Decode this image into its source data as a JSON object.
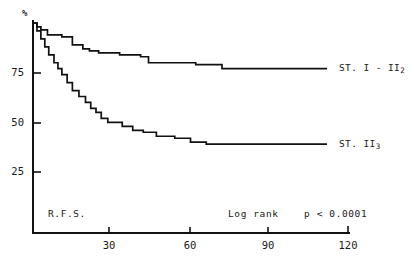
{
  "chart_data": {
    "type": "line",
    "title": "",
    "subtitle": "",
    "xlabel": "",
    "ylabel": "%",
    "xlim": [
      0,
      120
    ],
    "ylim": [
      0,
      100
    ],
    "grid": false,
    "legend_position": "right-inline",
    "x_ticks": [
      "30",
      "60",
      "90",
      "120"
    ],
    "x_tick_values": [
      30,
      60,
      90,
      120
    ],
    "y_ticks": [
      "25",
      "50",
      "75"
    ],
    "y_tick_values": [
      25,
      50,
      75
    ],
    "y_axis_symbol": "%",
    "annotations": [
      {
        "name": "endpoint",
        "text": "R.F.S."
      },
      {
        "name": "test-name",
        "text": "Log rank"
      },
      {
        "name": "p-value",
        "text": "p < 0.0001"
      }
    ],
    "series": [
      {
        "name": "ST. I - II2",
        "label_main": "ST. I - II",
        "label_sub": "2",
        "color": "#111111",
        "points": [
          [
            0,
            100
          ],
          [
            1.5,
            100
          ],
          [
            1.5,
            98
          ],
          [
            3,
            98
          ],
          [
            3,
            96.5
          ],
          [
            5.5,
            96.5
          ],
          [
            5.5,
            94
          ],
          [
            11,
            94
          ],
          [
            11,
            93
          ],
          [
            15,
            93
          ],
          [
            15,
            89
          ],
          [
            19,
            89
          ],
          [
            19,
            87
          ],
          [
            21.5,
            87
          ],
          [
            21.5,
            86
          ],
          [
            25,
            86
          ],
          [
            25,
            85
          ],
          [
            33,
            85
          ],
          [
            33,
            84
          ],
          [
            41,
            84
          ],
          [
            41,
            83
          ],
          [
            44,
            83
          ],
          [
            44,
            80
          ],
          [
            62,
            80
          ],
          [
            62,
            79
          ],
          [
            72,
            79
          ],
          [
            72,
            77
          ],
          [
            112,
            77
          ]
        ]
      },
      {
        "name": "ST. II3",
        "label_main": "ST. II",
        "label_sub": "3",
        "color": "#111111",
        "points": [
          [
            0,
            100
          ],
          [
            1.5,
            100
          ],
          [
            1.5,
            96
          ],
          [
            3,
            96
          ],
          [
            3,
            92
          ],
          [
            4.5,
            92
          ],
          [
            4.5,
            88
          ],
          [
            6,
            88
          ],
          [
            6,
            84
          ],
          [
            8,
            84
          ],
          [
            8,
            80
          ],
          [
            9.5,
            80
          ],
          [
            9.5,
            77
          ],
          [
            11,
            77
          ],
          [
            11,
            74
          ],
          [
            13,
            74
          ],
          [
            13,
            70
          ],
          [
            15,
            70
          ],
          [
            15,
            66
          ],
          [
            17.5,
            66
          ],
          [
            17.5,
            63
          ],
          [
            20,
            63
          ],
          [
            20,
            60
          ],
          [
            22,
            60
          ],
          [
            22,
            57
          ],
          [
            24,
            57
          ],
          [
            24,
            55
          ],
          [
            26,
            55
          ],
          [
            26,
            52
          ],
          [
            28.5,
            52
          ],
          [
            28.5,
            50
          ],
          [
            34,
            50
          ],
          [
            34,
            48
          ],
          [
            38,
            48
          ],
          [
            38,
            46
          ],
          [
            42,
            46
          ],
          [
            42,
            45
          ],
          [
            47,
            45
          ],
          [
            47,
            43
          ],
          [
            54,
            43
          ],
          [
            54,
            42
          ],
          [
            60,
            42
          ],
          [
            60,
            40
          ],
          [
            66,
            40
          ],
          [
            66,
            39
          ],
          [
            112,
            39
          ]
        ]
      }
    ]
  },
  "axis": {
    "y_axis_name": "y-axis-line",
    "x_axis_name": "x-axis-line"
  }
}
